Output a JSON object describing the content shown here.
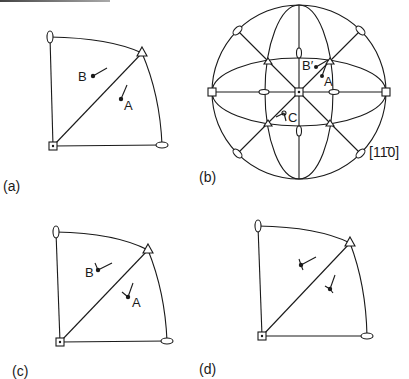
{
  "figure": {
    "panels": [
      {
        "id": "a",
        "label": "(a)",
        "type": "stereographic-triangle",
        "points": [
          {
            "name": "B"
          },
          {
            "name": "A"
          }
        ]
      },
      {
        "id": "b",
        "label": "(b)",
        "type": "stereographic-projection",
        "points": [
          {
            "name": "B′"
          },
          {
            "name": "A"
          },
          {
            "name": "C"
          }
        ],
        "direction_label": "[1̅0]"
      },
      {
        "id": "c",
        "label": "(c)",
        "type": "stereographic-triangle",
        "points": [
          {
            "name": "B"
          },
          {
            "name": "A"
          }
        ]
      },
      {
        "id": "d",
        "label": "(d)",
        "type": "stereographic-triangle",
        "points": []
      }
    ],
    "symbols": [
      "square (4-fold axis)",
      "triangle (3-fold axis)",
      "ellipse (2-fold axis)"
    ],
    "colors": {
      "ink": "#1a1a1a",
      "background": "#ffffff"
    }
  },
  "labels": {
    "a": "(a)",
    "b": "(b)",
    "c": "(c)",
    "d": "(d)",
    "a_B": "B",
    "a_A": "A",
    "b_B": "B′",
    "b_A": "A",
    "b_C": "C",
    "c_B": "B",
    "c_A": "A",
    "direction": "[11̄0]"
  }
}
